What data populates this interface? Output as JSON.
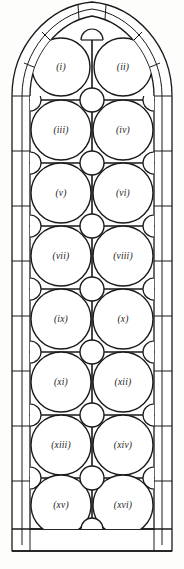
{
  "figure": {
    "background_color": "#fdfdfb",
    "line_color": "#1a1a1a",
    "glass_fill": "#ffffff",
    "stone_fill": "#ffffff"
  },
  "geometry": {
    "canvas_width": 184,
    "canvas_height": 569,
    "frame_outer_left": 12,
    "frame_outer_right": 172,
    "frame_inner_left": 30,
    "frame_inner_right": 154,
    "frame_mid_left": 22,
    "frame_mid_right": 162,
    "apex_y": 14,
    "arch_spring_y": 96,
    "sill_top_y": 529,
    "sill_bottom_y": 551,
    "mullion_x": 92,
    "row_pitch": 54,
    "first_row_center_y": 67,
    "panel_radius": 28,
    "roundel_radius": 12,
    "lobe_radius": 10
  },
  "panels": [
    {
      "id": "panel-1",
      "label": "(i)",
      "row": 1,
      "col": "left",
      "cx": 61,
      "cy": 67
    },
    {
      "id": "panel-2",
      "label": "(ii)",
      "row": 1,
      "col": "right",
      "cx": 123,
      "cy": 67
    },
    {
      "id": "panel-3",
      "label": "(iii)",
      "row": 2,
      "col": "left",
      "cx": 61,
      "cy": 130
    },
    {
      "id": "panel-4",
      "label": "(iv)",
      "row": 2,
      "col": "right",
      "cx": 123,
      "cy": 130
    },
    {
      "id": "panel-5",
      "label": "(v)",
      "row": 3,
      "col": "left",
      "cx": 61,
      "cy": 193
    },
    {
      "id": "panel-6",
      "label": "(vi)",
      "row": 3,
      "col": "right",
      "cx": 123,
      "cy": 193
    },
    {
      "id": "panel-7",
      "label": "(vii)",
      "row": 4,
      "col": "left",
      "cx": 61,
      "cy": 256
    },
    {
      "id": "panel-8",
      "label": "(viii)",
      "row": 4,
      "col": "right",
      "cx": 123,
      "cy": 256
    },
    {
      "id": "panel-9",
      "label": "(ix)",
      "row": 5,
      "col": "left",
      "cx": 61,
      "cy": 319
    },
    {
      "id": "panel-10",
      "label": "(x)",
      "row": 5,
      "col": "right",
      "cx": 123,
      "cy": 319
    },
    {
      "id": "panel-11",
      "label": "(xi)",
      "row": 6,
      "col": "left",
      "cx": 61,
      "cy": 382
    },
    {
      "id": "panel-12",
      "label": "(xii)",
      "row": 6,
      "col": "right",
      "cx": 123,
      "cy": 382
    },
    {
      "id": "panel-13",
      "label": "(xiii)",
      "row": 7,
      "col": "left",
      "cx": 61,
      "cy": 445
    },
    {
      "id": "panel-14",
      "label": "(xiv)",
      "row": 7,
      "col": "right",
      "cx": 123,
      "cy": 445
    },
    {
      "id": "panel-15",
      "label": "(xv)",
      "row": 8,
      "col": "left",
      "cx": 61,
      "cy": 505
    },
    {
      "id": "panel-16",
      "label": "(xvi)",
      "row": 8,
      "col": "right",
      "cx": 123,
      "cy": 505
    }
  ],
  "roundels": [
    {
      "id": "roundel-1",
      "cx": 92,
      "cy": 100
    },
    {
      "id": "roundel-2",
      "cx": 92,
      "cy": 163
    },
    {
      "id": "roundel-3",
      "cx": 92,
      "cy": 226
    },
    {
      "id": "roundel-4",
      "cx": 92,
      "cy": 289
    },
    {
      "id": "roundel-5",
      "cx": 92,
      "cy": 352
    },
    {
      "id": "roundel-6",
      "cx": 92,
      "cy": 415
    },
    {
      "id": "roundel-7",
      "cx": 92,
      "cy": 478
    }
  ],
  "edge_lobes": [
    {
      "id": "lobe-left-1",
      "side": "left",
      "cx": 30,
      "cy": 100
    },
    {
      "id": "lobe-left-2",
      "side": "left",
      "cx": 30,
      "cy": 163
    },
    {
      "id": "lobe-left-3",
      "side": "left",
      "cx": 30,
      "cy": 226
    },
    {
      "id": "lobe-left-4",
      "side": "left",
      "cx": 30,
      "cy": 289
    },
    {
      "id": "lobe-left-5",
      "side": "left",
      "cx": 30,
      "cy": 352
    },
    {
      "id": "lobe-left-6",
      "side": "left",
      "cx": 30,
      "cy": 415
    },
    {
      "id": "lobe-left-7",
      "side": "left",
      "cx": 30,
      "cy": 478
    },
    {
      "id": "lobe-right-1",
      "side": "right",
      "cx": 154,
      "cy": 100
    },
    {
      "id": "lobe-right-2",
      "side": "right",
      "cx": 154,
      "cy": 163
    },
    {
      "id": "lobe-right-3",
      "side": "right",
      "cx": 154,
      "cy": 226
    },
    {
      "id": "lobe-right-4",
      "side": "right",
      "cx": 154,
      "cy": 289
    },
    {
      "id": "lobe-right-5",
      "side": "right",
      "cx": 154,
      "cy": 352
    },
    {
      "id": "lobe-right-6",
      "side": "right",
      "cx": 154,
      "cy": 415
    },
    {
      "id": "lobe-right-7",
      "side": "right",
      "cx": 154,
      "cy": 478
    }
  ],
  "transom_rows_y": [
    100,
    163,
    226,
    289,
    352,
    415,
    478
  ],
  "frame_joints_left_y": [
    120,
    175,
    230,
    285,
    340,
    395,
    450,
    505
  ],
  "frame_joints_right_y": [
    120,
    175,
    230,
    285,
    340,
    395,
    450,
    505
  ],
  "arch_joints": [
    {
      "id": "arch-joint-left-1",
      "side": "left",
      "t": 0.3
    },
    {
      "id": "arch-joint-left-2",
      "side": "left",
      "t": 0.62
    },
    {
      "id": "arch-joint-right-1",
      "side": "right",
      "t": 0.3
    },
    {
      "id": "arch-joint-right-2",
      "side": "right",
      "t": 0.62
    }
  ],
  "apex_features": {
    "keystone_label": "apex-keystone",
    "apex_semicircle_cx": 92,
    "apex_semicircle_cy": 40,
    "apex_semicircle_r": 11
  }
}
